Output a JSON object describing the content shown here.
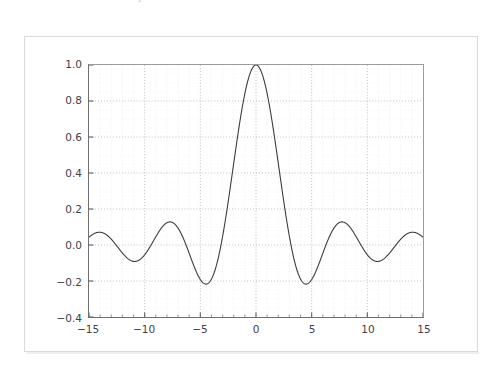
{
  "header": {
    "cropped_text": "— . — — — — —"
  },
  "figure": {
    "background_color": "#ffffff",
    "frame_color": "#d8dade"
  },
  "chart_data": {
    "type": "line",
    "title": "",
    "subtitle": "",
    "xlabel": "",
    "ylabel": "",
    "function": "sin(x)/x",
    "xlim": [
      -15,
      15
    ],
    "ylim": [
      -0.4,
      1.0
    ],
    "grid": true,
    "grid_style": "dotted",
    "grid_minor": true,
    "legend": null,
    "legend_position": "none",
    "line_color": "#3c3c3c",
    "line_width": 1.1,
    "xticks": [
      -15,
      -10,
      -5,
      0,
      5,
      10,
      15
    ],
    "xticklabels": [
      "−15",
      "−10",
      "−5",
      "0",
      "5",
      "10",
      "15"
    ],
    "xtick_minor_step": 1,
    "yticks": [
      -0.4,
      -0.2,
      0.0,
      0.2,
      0.4,
      0.6,
      0.8,
      1.0
    ],
    "yticklabels": [
      "−0.4",
      "−0.2",
      "0.0",
      "0.2",
      "0.4",
      "0.6",
      "0.8",
      "1.0"
    ],
    "ytick_minor_step": 0.05,
    "x": [
      -15.0,
      -14.7,
      -14.4,
      -14.1,
      -13.8,
      -13.5,
      -13.2,
      -12.9,
      -12.6,
      -12.3,
      -12.0,
      -11.7,
      -11.4,
      -11.1,
      -10.8,
      -10.5,
      -10.2,
      -9.9,
      -9.6,
      -9.3,
      -9.0,
      -8.7,
      -8.4,
      -8.1,
      -7.8,
      -7.5,
      -7.2,
      -6.9,
      -6.6,
      -6.3,
      -6.0,
      -5.7,
      -5.4,
      -5.1,
      -4.8,
      -4.5,
      -4.2,
      -3.9,
      -3.6,
      -3.3,
      -3.0,
      -2.7,
      -2.4,
      -2.1,
      -1.8,
      -1.5,
      -1.2,
      -0.9,
      -0.6,
      -0.3,
      0.0,
      0.3,
      0.6,
      0.9,
      1.2,
      1.5,
      1.8,
      2.1,
      2.4,
      2.7,
      3.0,
      3.3,
      3.6,
      3.9,
      4.2,
      4.5,
      4.8,
      5.1,
      5.4,
      5.7,
      6.0,
      6.3,
      6.6,
      6.9,
      7.2,
      7.5,
      7.8,
      8.1,
      8.4,
      8.7,
      9.0,
      9.3,
      9.6,
      9.9,
      10.2,
      10.5,
      10.8,
      11.1,
      11.4,
      11.7,
      12.0,
      12.3,
      12.6,
      12.9,
      13.2,
      13.5,
      13.8,
      14.1,
      14.4,
      14.7,
      15.0
    ],
    "y": [
      0.043,
      0.0606,
      0.0688,
      0.0666,
      0.0546,
      0.0351,
      0.0114,
      -0.0126,
      -0.0332,
      -0.0472,
      -0.0447,
      -0.0456,
      -0.0854,
      -0.0888,
      -0.0918,
      -0.0842,
      -0.0666,
      -0.0412,
      -0.0114,
      0.0189,
      0.0458,
      0.0661,
      0.0774,
      0.0787,
      0.0699,
      0.0525,
      0.0287,
      0.0018,
      -0.0247,
      -0.0474,
      -0.0466,
      -0.0977,
      -0.1423,
      -0.1794,
      -0.2057,
      -0.2172,
      -0.2087,
      -0.1793,
      -0.1225,
      -0.0481,
      0.047,
      0.1562,
      0.2811,
      0.4107,
      0.5409,
      0.665,
      0.7767,
      0.8704,
      0.9411,
      0.9851,
      1.0,
      0.9851,
      0.9411,
      0.8704,
      0.7767,
      0.665,
      0.5409,
      0.4107,
      0.2811,
      0.1562,
      0.047,
      -0.0481,
      -0.1225,
      -0.1793,
      -0.2087,
      -0.2172,
      -0.2057,
      -0.1794,
      -0.1423,
      -0.0977,
      -0.0466,
      -0.0474,
      -0.0247,
      0.0018,
      0.0287,
      0.0525,
      0.0699,
      0.0787,
      0.0774,
      0.0661,
      0.0458,
      0.0189,
      -0.0114,
      -0.0412,
      -0.0666,
      -0.0842,
      -0.0918,
      -0.0888,
      -0.0854,
      -0.0456,
      -0.0447,
      -0.0472,
      -0.0332,
      -0.0126,
      0.0114,
      0.0351,
      0.0546,
      0.0666,
      0.0688,
      0.0606,
      0.043
    ]
  }
}
